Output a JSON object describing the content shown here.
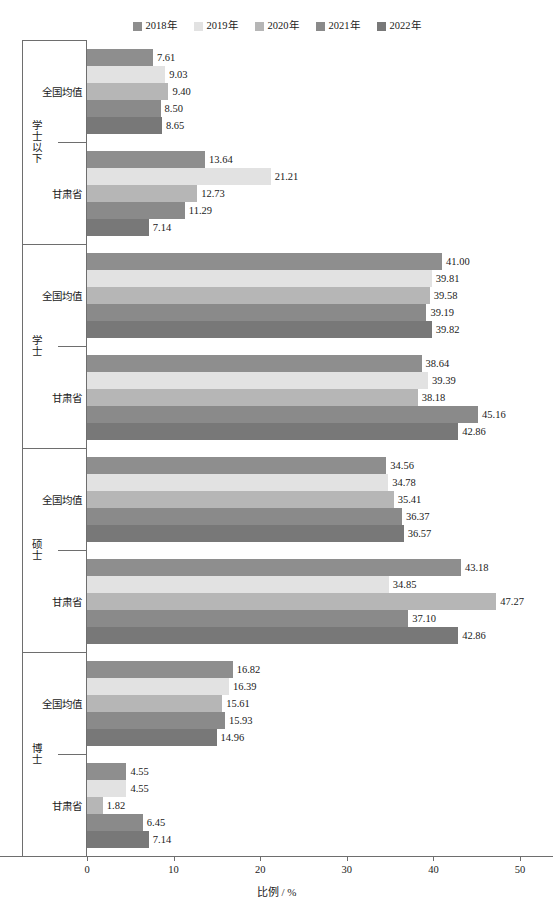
{
  "legend": {
    "position": "top-center",
    "items": [
      {
        "label": "2018年",
        "color": "#8e8e8e"
      },
      {
        "label": "2019年",
        "color": "#e2e2e2"
      },
      {
        "label": "2020年",
        "color": "#b6b6b6"
      },
      {
        "label": "2021年",
        "color": "#8a8a8a"
      },
      {
        "label": "2022年",
        "color": "#787878"
      }
    ]
  },
  "axis": {
    "x_title": "比例 / %",
    "x_ticks": [
      "0",
      "10",
      "20",
      "30",
      "40",
      "50"
    ],
    "x_min": 0,
    "x_max": 50
  },
  "groups": [
    {
      "label": "学士以下",
      "subgroups": [
        {
          "label": "全国均值",
          "values": [
            "7.61",
            "9.03",
            "9.40",
            "8.50",
            "8.65"
          ]
        },
        {
          "label": "甘肃省",
          "values": [
            "13.64",
            "21.21",
            "12.73",
            "11.29",
            "7.14"
          ]
        }
      ]
    },
    {
      "label": "学士",
      "subgroups": [
        {
          "label": "全国均值",
          "values": [
            "41.00",
            "39.81",
            "39.58",
            "39.19",
            "39.82"
          ]
        },
        {
          "label": "甘肃省",
          "values": [
            "38.64",
            "39.39",
            "38.18",
            "45.16",
            "42.86"
          ]
        }
      ]
    },
    {
      "label": "硕士",
      "subgroups": [
        {
          "label": "全国均值",
          "values": [
            "34.56",
            "34.78",
            "35.41",
            "36.37",
            "36.57"
          ]
        },
        {
          "label": "甘肃省",
          "values": [
            "43.18",
            "34.85",
            "47.27",
            "37.10",
            "42.86"
          ]
        }
      ]
    },
    {
      "label": "博士",
      "subgroups": [
        {
          "label": "全国均值",
          "values": [
            "16.82",
            "16.39",
            "15.61",
            "15.93",
            "14.96"
          ]
        },
        {
          "label": "甘肃省",
          "values": [
            "4.55",
            "4.55",
            "1.82",
            "6.45",
            "7.14"
          ]
        }
      ]
    }
  ],
  "chart_data": {
    "type": "bar",
    "orientation": "horizontal",
    "title": "",
    "xlabel": "比例 / %",
    "ylabel": "",
    "xlim": [
      0,
      50
    ],
    "grid": false,
    "legend_position": "top-center",
    "categories": [
      "学士以下 - 全国均值",
      "学士以下 - 甘肃省",
      "学士 - 全国均值",
      "学士 - 甘肃省",
      "硕士 - 全国均值",
      "硕士 - 甘肃省",
      "博士 - 全国均值",
      "博士 - 甘肃省"
    ],
    "series": [
      {
        "name": "2018年",
        "color": "#8e8e8e",
        "values": [
          7.61,
          13.64,
          41.0,
          38.64,
          34.56,
          43.18,
          16.82,
          4.55
        ]
      },
      {
        "name": "2019年",
        "color": "#e2e2e2",
        "values": [
          9.03,
          21.21,
          39.81,
          39.39,
          34.78,
          34.85,
          16.39,
          4.55
        ]
      },
      {
        "name": "2020年",
        "color": "#b6b6b6",
        "values": [
          9.4,
          12.73,
          39.58,
          38.18,
          35.41,
          47.27,
          15.61,
          1.82
        ]
      },
      {
        "name": "2021年",
        "color": "#8a8a8a",
        "values": [
          8.5,
          11.29,
          39.19,
          45.16,
          36.37,
          37.1,
          15.93,
          6.45
        ]
      },
      {
        "name": "2022年",
        "color": "#787878",
        "values": [
          8.65,
          7.14,
          39.82,
          42.86,
          36.57,
          42.86,
          14.96,
          7.14
        ]
      }
    ]
  }
}
